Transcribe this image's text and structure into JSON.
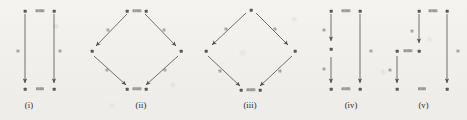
{
  "figure": {
    "background_color": "#f3f1ee",
    "ink_color": "#4b4742",
    "kind": "commutative-diagram-row",
    "width": 467,
    "height": 120
  },
  "diagrams": [
    {
      "id": "i",
      "caption": "(i)",
      "shape": "square",
      "vertices": 4,
      "arrows": 2,
      "arrow_description": "two parallel vertical arrows pointing downward, left and right sides of a square",
      "labels_legible": false
    },
    {
      "id": "ii",
      "caption": "(ii)",
      "shape": "diamond",
      "vertices": 4,
      "arrows": 4,
      "arrow_description": "top vertex with two arrows out to left and right vertices, both of which arrow down into the bottom vertex",
      "labels_legible": false
    },
    {
      "id": "iii",
      "caption": "(iii)",
      "shape": "diamond",
      "vertices": 4,
      "arrows": 4,
      "arrow_description": "top vertex with two arrows out to left and right vertices, both of which arrow down into the bottom vertex",
      "labels_legible": false
    },
    {
      "id": "iv",
      "caption": "(iv)",
      "shape": "split-column",
      "vertices": 5,
      "arrows": 3,
      "arrow_description": "left column broken into two stacked downward arrows through a middle vertex; right column a single long downward arrow",
      "labels_legible": false
    },
    {
      "id": "v",
      "caption": "(v)",
      "shape": "staircase",
      "vertices": 6,
      "arrows": 3,
      "arrow_description": "an upper middle downward arrow, a lower left downward arrow offset below it, and a tall right-hand downward arrow",
      "labels_legible": false
    }
  ],
  "captions": {
    "i": "(i)",
    "ii": "(ii)",
    "iii": "(iii)",
    "iv": "(iv)",
    "v": "(v)"
  }
}
